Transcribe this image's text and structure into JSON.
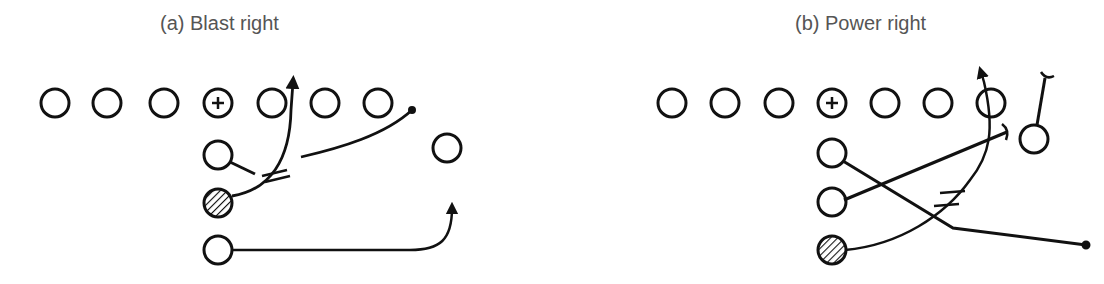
{
  "diagrams": [
    {
      "id": "a",
      "title": "(a) Blast right"
    },
    {
      "id": "b",
      "title": "(b) Power right"
    }
  ],
  "legend": {
    "center_symbol": "+",
    "ball_carrier": "hatched circle"
  }
}
